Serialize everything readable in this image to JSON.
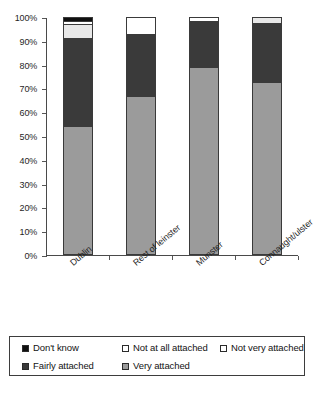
{
  "chart_data": {
    "type": "bar",
    "subtype": "stacked-percentage-column",
    "title": "",
    "subtitle": "",
    "xlabel": "",
    "ylabel": "",
    "ylim": [
      0,
      100
    ],
    "ytick_labels": [
      "0%",
      "10%",
      "20%",
      "30%",
      "40%",
      "50%",
      "60%",
      "70%",
      "80%",
      "90%",
      "100%"
    ],
    "ytick_values": [
      0,
      10,
      20,
      30,
      40,
      50,
      60,
      70,
      80,
      90,
      100
    ],
    "grid": false,
    "legend_position": "bottom",
    "categories": [
      "Dublin",
      "Rest of leinster",
      "Munster",
      "Connaught/ulster"
    ],
    "stack_order_bottom_to_top": [
      "Very attached",
      "Fairly attached",
      "Not very attached",
      "Not at all attached",
      "Don't know"
    ],
    "series": [
      {
        "name": "Very attached",
        "color": "#9b9b9b",
        "values": [
          54.0,
          66.5,
          79.0,
          72.5
        ]
      },
      {
        "name": "Fairly attached",
        "color": "#3a3a3a",
        "values": [
          37.0,
          26.5,
          19.5,
          25.0
        ]
      },
      {
        "name": "Not very attached",
        "color": "#e8e8e8",
        "values": [
          6.0,
          0.0,
          0.0,
          2.5
        ]
      },
      {
        "name": "Not at all attached",
        "color": "#ffffff",
        "values": [
          1.5,
          7.0,
          1.5,
          0.0
        ]
      },
      {
        "name": "Don't know",
        "color": "#101010",
        "values": [
          1.5,
          0.0,
          0.0,
          0.0
        ]
      }
    ]
  },
  "legend": {
    "rows": [
      [
        {
          "label": "Don't know",
          "color": "#101010"
        },
        {
          "label": "Not at all attached",
          "color": "#ffffff"
        },
        {
          "label": "Not very attached",
          "color": "#ffffff"
        }
      ],
      [
        {
          "label": "Fairly attached",
          "color": "#3a3a3a"
        },
        {
          "label": "Very attached",
          "color": "#9b9b9b"
        }
      ]
    ]
  }
}
